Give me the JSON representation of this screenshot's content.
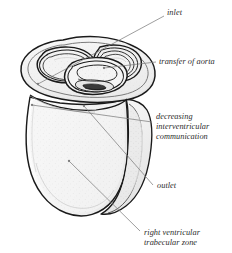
{
  "figure": {
    "kind": "anatomical-line-drawing",
    "background_color": "#ffffff",
    "ink_color": "#1a1a1a",
    "leader_color": "#7d7d7d",
    "shading_color": "#ededed",
    "text_color": "#2b2b2b"
  },
  "annotations": [
    {
      "id": "inlet",
      "label": "inlet",
      "x": 167,
      "y": 8,
      "leader": {
        "x1": 164,
        "y1": 16,
        "x2": 38,
        "y2": 84,
        "dot_x": 38,
        "dot_y": 84
      }
    },
    {
      "id": "transfer-of-aorta",
      "label": "transfer of aorta",
      "x": 159,
      "y": 57,
      "leader": {
        "x1": 156,
        "y1": 62,
        "x2": 104,
        "y2": 68,
        "dot_x": 104,
        "dot_y": 68
      }
    },
    {
      "id": "decreasing-interventricular-communication",
      "label": "decreasing\ninterventricular\ncommunication",
      "x": 156,
      "y": 112,
      "leader": {
        "x1": 152,
        "y1": 122,
        "x2": 32,
        "y2": 105,
        "dot_x": 32,
        "dot_y": 105
      }
    },
    {
      "id": "outlet",
      "label": "outlet",
      "x": 157,
      "y": 181,
      "leader": {
        "x1": 153,
        "y1": 185,
        "x2": 84,
        "y2": 106,
        "dot_x": 84,
        "dot_y": 106
      }
    },
    {
      "id": "right-ventricular-trabecular-zone",
      "label": "right ventricular\ntrabecular zone",
      "x": 144,
      "y": 228,
      "leader": {
        "x1": 140,
        "y1": 231,
        "x2": 69,
        "y2": 161,
        "dot_x": 69,
        "dot_y": 161
      }
    }
  ]
}
